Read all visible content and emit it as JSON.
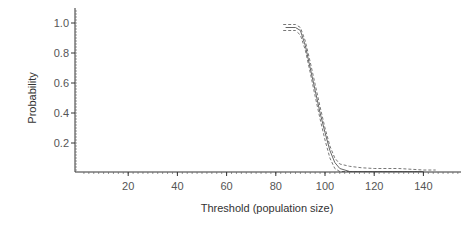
{
  "chart_data": {
    "type": "line",
    "title": "",
    "xlabel": "Threshold (population size)",
    "ylabel": "Probability",
    "xlim": [
      0,
      155
    ],
    "ylim": [
      0,
      1.1
    ],
    "xticks": [
      20,
      40,
      60,
      80,
      100,
      120,
      140
    ],
    "yticks": [
      0.2,
      0.4,
      0.6,
      0.8,
      1.0
    ],
    "ytick_labels": [
      "0.2",
      "0.4",
      "0.6",
      "0.8",
      "1.0"
    ],
    "grid": false,
    "legend": null,
    "series": [
      {
        "name": "estimate",
        "style": "solid",
        "color": "#666666",
        "x": [
          84,
          88,
          90,
          92,
          94,
          96,
          98,
          100,
          102,
          104,
          106,
          110,
          115,
          120,
          130,
          140
        ],
        "y": [
          0.97,
          0.97,
          0.95,
          0.85,
          0.7,
          0.55,
          0.4,
          0.27,
          0.15,
          0.07,
          0.03,
          0.01,
          0.005,
          0.003,
          0.002,
          0.002
        ]
      },
      {
        "name": "upper bound",
        "style": "dashed",
        "color": "#777777",
        "x": [
          83,
          88,
          90,
          92,
          94,
          96,
          98,
          100,
          102,
          104,
          106,
          110,
          115,
          120,
          130,
          140,
          145
        ],
        "y": [
          0.99,
          0.99,
          0.97,
          0.88,
          0.74,
          0.59,
          0.44,
          0.3,
          0.18,
          0.1,
          0.06,
          0.045,
          0.035,
          0.03,
          0.03,
          0.02,
          0.02
        ]
      },
      {
        "name": "lower bound",
        "style": "dashed",
        "color": "#777777",
        "x": [
          83,
          88,
          90,
          92,
          94,
          96,
          98,
          100,
          102,
          104,
          106,
          110,
          120,
          140
        ],
        "y": [
          0.95,
          0.95,
          0.92,
          0.82,
          0.67,
          0.51,
          0.36,
          0.22,
          0.1,
          0.03,
          0.005,
          0.0,
          0.0,
          0.0
        ]
      }
    ]
  }
}
